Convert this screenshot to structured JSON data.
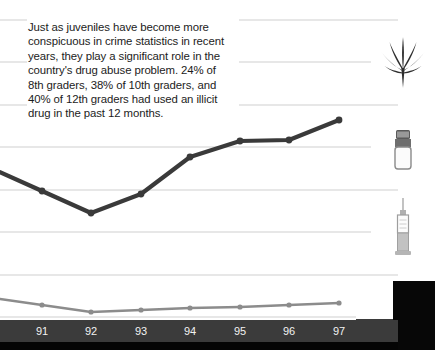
{
  "caption": {
    "text": "Just as juveniles have become more conspicuous in crime statistics in recent years, they play a significant role in the country's drug abuse problem. 24% of 8th graders, 38% of 10th graders, and 40% of 12th graders had used an illicit drug in the past 12 months."
  },
  "icons": [
    {
      "name": "cannabis-leaf-icon",
      "label": "cannabis leaf"
    },
    {
      "name": "pill-bottle-icon",
      "label": "pill bottle"
    },
    {
      "name": "syringe-icon",
      "label": "syringe"
    }
  ],
  "colors": {
    "primary_line": "#3a3a3a",
    "secondary_line": "#8c8c8c",
    "gridline": "#cfcfcf",
    "axis_band": "#3b3b3b",
    "axis_text": "#f2f2f2",
    "text": "#1c1c1c",
    "black_panel": "#070707"
  },
  "chart_data": {
    "type": "line",
    "title": "",
    "xlabel": "",
    "ylabel": "",
    "grid": true,
    "legend": "none",
    "categories": [
      "91",
      "92",
      "93",
      "94",
      "95",
      "96",
      "97"
    ],
    "x_pixels": [
      42,
      91,
      141,
      190,
      240,
      289,
      339
    ],
    "gridline_y_pixels": [
      20,
      62,
      105,
      147,
      190,
      232,
      275,
      317
    ],
    "series": [
      {
        "name": "Primary trend",
        "color": "#3a3a3a",
        "y_pixels": [
          191,
          213,
          194,
          157,
          141,
          140,
          120
        ],
        "values": [
          45,
          39,
          44,
          55,
          59,
          59,
          65
        ],
        "markers": true
      },
      {
        "name": "Secondary trend",
        "color": "#8c8c8c",
        "y_pixels": [
          305,
          312,
          310,
          308,
          307,
          305,
          303
        ],
        "values": [
          12,
          10,
          11,
          11,
          12,
          12,
          13
        ],
        "markers": true
      }
    ]
  }
}
